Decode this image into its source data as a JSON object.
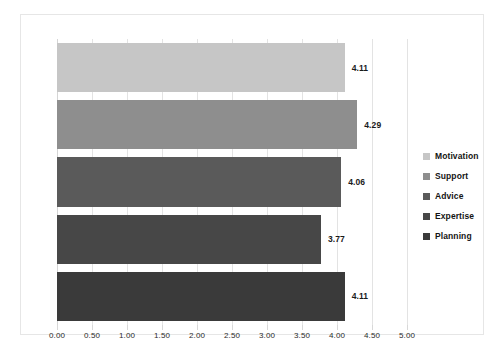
{
  "chart_data": {
    "type": "bar",
    "orientation": "horizontal",
    "title": "",
    "xlabel": "",
    "ylabel": "",
    "xlim": [
      0,
      5
    ],
    "xticks": [
      "0.00",
      "0.50",
      "1.00",
      "1.50",
      "2.00",
      "2.50",
      "3.00",
      "3.50",
      "4.00",
      "4.50",
      "5.00"
    ],
    "xtick_values": [
      0,
      0.5,
      1,
      1.5,
      2,
      2.5,
      3,
      3.5,
      4,
      4.5,
      5
    ],
    "grid": true,
    "legend_position": "right",
    "categories": [
      "Motivation",
      "Support",
      "Advice",
      "Expertise",
      "Planning"
    ],
    "values": [
      4.11,
      4.29,
      4.06,
      3.77,
      4.11
    ],
    "data_labels": [
      "4.11",
      "4.29",
      "4.06",
      "3.77",
      "4.11"
    ],
    "colors": [
      "#c6c6c6",
      "#8e8e8e",
      "#5a5a5a",
      "#474747",
      "#3a3a3a"
    ],
    "bars": [
      {
        "category": "Motivation",
        "value": 4.11,
        "label": "4.11",
        "color": "#c6c6c6"
      },
      {
        "category": "Support",
        "value": 4.29,
        "label": "4.29",
        "color": "#8e8e8e"
      },
      {
        "category": "Advice",
        "value": 4.06,
        "label": "4.06",
        "color": "#5a5a5a"
      },
      {
        "category": "Expertise",
        "value": 3.77,
        "label": "3.77",
        "color": "#474747"
      },
      {
        "category": "Planning",
        "value": 4.11,
        "label": "4.11",
        "color": "#3a3a3a"
      }
    ]
  },
  "legend": {
    "items": [
      {
        "label": "Motivation",
        "color": "#c6c6c6"
      },
      {
        "label": "Support",
        "color": "#8e8e8e"
      },
      {
        "label": "Advice",
        "color": "#5a5a5a"
      },
      {
        "label": "Expertise",
        "color": "#474747"
      },
      {
        "label": "Planning",
        "color": "#3a3a3a"
      }
    ]
  },
  "style": {
    "frame_border": "#e6e6e6",
    "gridline": "#e3e3e3",
    "background": "#ffffff",
    "label_text": "#1a1a1a"
  }
}
